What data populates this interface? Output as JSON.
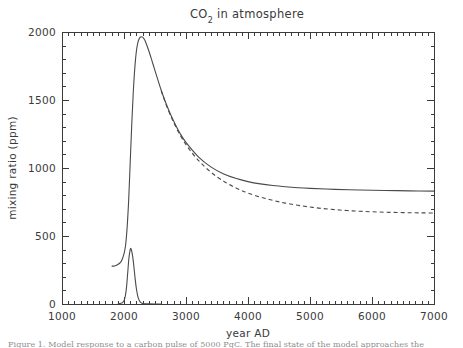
{
  "figure": {
    "title": "CO2 in atmosphere",
    "title_prefix": "CO",
    "title_subscript": "2",
    "title_suffix": " in atmosphere",
    "caption_partial": "Figure 1. Model response to a carbon pulse of 5000 PgC. The final state of the model approaches the"
  },
  "chart_data": {
    "type": "line",
    "title": "CO2 in atmosphere",
    "xlabel": "year AD",
    "ylabel": "mixing ratio (ppm)",
    "xlim": [
      1000,
      7000
    ],
    "ylim": [
      0,
      2000
    ],
    "xticks": [
      1000,
      2000,
      3000,
      4000,
      5000,
      6000,
      7000
    ],
    "yticks": [
      0,
      500,
      1000,
      1500,
      2000
    ],
    "x_minor_per_major": 10,
    "y_minor_per_major": 5,
    "grid": false,
    "legend": "none",
    "series": [
      {
        "name": "atmospheric CO2 (with weathering)",
        "style": "solid",
        "color": "#4a4a4a",
        "points": [
          [
            1800,
            278
          ],
          [
            1850,
            280
          ],
          [
            1900,
            290
          ],
          [
            1950,
            310
          ],
          [
            1980,
            340
          ],
          [
            2000,
            370
          ],
          [
            2025,
            430
          ],
          [
            2050,
            560
          ],
          [
            2075,
            760
          ],
          [
            2100,
            1040
          ],
          [
            2125,
            1320
          ],
          [
            2150,
            1560
          ],
          [
            2175,
            1740
          ],
          [
            2200,
            1860
          ],
          [
            2225,
            1925
          ],
          [
            2250,
            1955
          ],
          [
            2275,
            1965
          ],
          [
            2300,
            1962
          ],
          [
            2325,
            1948
          ],
          [
            2350,
            1925
          ],
          [
            2400,
            1862
          ],
          [
            2450,
            1790
          ],
          [
            2500,
            1716
          ],
          [
            2600,
            1572
          ],
          [
            2700,
            1448
          ],
          [
            2800,
            1345
          ],
          [
            2900,
            1258
          ],
          [
            3000,
            1188
          ],
          [
            3200,
            1082
          ],
          [
            3400,
            1008
          ],
          [
            3600,
            958
          ],
          [
            3800,
            924
          ],
          [
            4000,
            900
          ],
          [
            4200,
            883
          ],
          [
            4400,
            871
          ],
          [
            4600,
            862
          ],
          [
            4800,
            855
          ],
          [
            5000,
            850
          ],
          [
            5400,
            843
          ],
          [
            5800,
            838
          ],
          [
            6200,
            835
          ],
          [
            6600,
            832
          ],
          [
            7000,
            830
          ]
        ]
      },
      {
        "name": "atmospheric CO2 (no weathering)",
        "style": "dashed",
        "color": "#4a4a4a",
        "points": [
          [
            2600,
            1568
          ],
          [
            2700,
            1442
          ],
          [
            2800,
            1336
          ],
          [
            2900,
            1246
          ],
          [
            3000,
            1172
          ],
          [
            3100,
            1110
          ],
          [
            3200,
            1056
          ],
          [
            3300,
            1010
          ],
          [
            3400,
            970
          ],
          [
            3500,
            935
          ],
          [
            3600,
            905
          ],
          [
            3700,
            878
          ],
          [
            3800,
            855
          ],
          [
            3900,
            834
          ],
          [
            4000,
            816
          ],
          [
            4200,
            786
          ],
          [
            4400,
            762
          ],
          [
            4600,
            742
          ],
          [
            4800,
            726
          ],
          [
            5000,
            713
          ],
          [
            5200,
            702
          ],
          [
            5400,
            694
          ],
          [
            5600,
            687
          ],
          [
            5800,
            682
          ],
          [
            6000,
            678
          ],
          [
            6200,
            675
          ],
          [
            6400,
            673
          ],
          [
            6600,
            671
          ],
          [
            6800,
            670
          ],
          [
            7000,
            669
          ]
        ]
      },
      {
        "name": "CO2 emission pulse",
        "style": "solid",
        "color": "#4a4a4a",
        "points": [
          [
            1900,
            2
          ],
          [
            1950,
            5
          ],
          [
            1980,
            12
          ],
          [
            2000,
            25
          ],
          [
            2020,
            55
          ],
          [
            2040,
            120
          ],
          [
            2060,
            230
          ],
          [
            2080,
            340
          ],
          [
            2100,
            400
          ],
          [
            2110,
            408
          ],
          [
            2120,
            398
          ],
          [
            2140,
            350
          ],
          [
            2160,
            272
          ],
          [
            2180,
            185
          ],
          [
            2200,
            112
          ],
          [
            2220,
            62
          ],
          [
            2240,
            32
          ],
          [
            2260,
            16
          ],
          [
            2280,
            8
          ],
          [
            2300,
            4
          ],
          [
            2350,
            2
          ],
          [
            2400,
            1
          ],
          [
            2500,
            0
          ],
          [
            2600,
            0
          ]
        ]
      }
    ]
  }
}
